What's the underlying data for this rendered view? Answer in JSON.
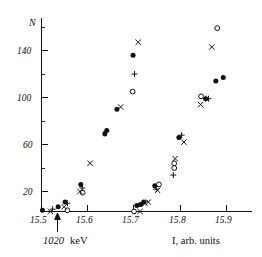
{
  "chart_data": {
    "type": "scatter",
    "title": "",
    "xlabel": "I, arb. units",
    "ylabel": "N",
    "xlim": [
      15.47,
      15.93
    ],
    "ylim": [
      0,
      165
    ],
    "grid": false,
    "legend_position": "none",
    "xticks": [
      "15.5",
      "15.6",
      "15.7",
      "15.8",
      "15.9"
    ],
    "xtick_values": [
      15.5,
      15.6,
      15.7,
      15.8,
      15.9
    ],
    "yticks": [
      "20",
      "60",
      "100",
      "140"
    ],
    "ytick_values": [
      20,
      60,
      100,
      140
    ],
    "annotations": [
      {
        "name": "threshold-arrow",
        "value_text": "1020",
        "unit_text": "keV",
        "x": 15.535
      }
    ],
    "series": [
      {
        "name": "filled-circle",
        "marker": "filled-circle",
        "points": [
          {
            "x": 15.502,
            "y": 4
          },
          {
            "x": 15.536,
            "y": 7
          },
          {
            "x": 15.551,
            "y": 11
          },
          {
            "x": 15.585,
            "y": 26
          },
          {
            "x": 15.637,
            "y": 69
          },
          {
            "x": 15.641,
            "y": 72
          },
          {
            "x": 15.663,
            "y": 90
          },
          {
            "x": 15.698,
            "y": 136
          },
          {
            "x": 15.706,
            "y": 8
          },
          {
            "x": 15.714,
            "y": 9
          },
          {
            "x": 15.721,
            "y": 11
          },
          {
            "x": 15.745,
            "y": 25
          },
          {
            "x": 15.797,
            "y": 66
          },
          {
            "x": 15.855,
            "y": 99
          },
          {
            "x": 15.877,
            "y": 114
          },
          {
            "x": 15.893,
            "y": 117
          }
        ]
      },
      {
        "name": "open-circle",
        "marker": "open-circle",
        "points": [
          {
            "x": 15.556,
            "y": 4
          },
          {
            "x": 15.589,
            "y": 19
          },
          {
            "x": 15.697,
            "y": 105
          },
          {
            "x": 15.7,
            "y": 3
          },
          {
            "x": 15.754,
            "y": 26
          },
          {
            "x": 15.787,
            "y": 40
          },
          {
            "x": 15.787,
            "y": 44
          },
          {
            "x": 15.845,
            "y": 101
          },
          {
            "x": 15.88,
            "y": 159
          }
        ]
      },
      {
        "name": "cross",
        "marker": "cross",
        "points": [
          {
            "x": 15.519,
            "y": 3
          },
          {
            "x": 15.549,
            "y": 7
          },
          {
            "x": 15.583,
            "y": 20
          },
          {
            "x": 15.605,
            "y": 44
          },
          {
            "x": 15.671,
            "y": 92
          },
          {
            "x": 15.709,
            "y": 147
          },
          {
            "x": 15.713,
            "y": 3
          },
          {
            "x": 15.724,
            "y": 10
          },
          {
            "x": 15.731,
            "y": 11
          },
          {
            "x": 15.751,
            "y": 21
          },
          {
            "x": 15.789,
            "y": 48
          },
          {
            "x": 15.808,
            "y": 62
          },
          {
            "x": 15.844,
            "y": 94
          },
          {
            "x": 15.868,
            "y": 143
          }
        ]
      },
      {
        "name": "plus",
        "marker": "plus",
        "points": [
          {
            "x": 15.524,
            "y": 5
          },
          {
            "x": 15.556,
            "y": 10
          },
          {
            "x": 15.588,
            "y": 23
          },
          {
            "x": 15.64,
            "y": 71
          },
          {
            "x": 15.701,
            "y": 120
          },
          {
            "x": 15.719,
            "y": 10
          },
          {
            "x": 15.748,
            "y": 22
          },
          {
            "x": 15.785,
            "y": 34
          },
          {
            "x": 15.803,
            "y": 68
          },
          {
            "x": 15.855,
            "y": 99
          },
          {
            "x": 15.861,
            "y": 99
          }
        ]
      }
    ]
  }
}
